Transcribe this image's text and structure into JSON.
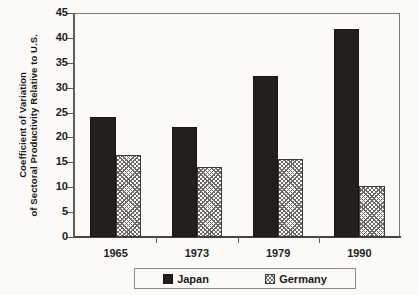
{
  "chart_data": {
    "type": "bar",
    "title": "",
    "xlabel": "",
    "ylabel_line1": "Coefficient of Variation",
    "ylabel_line2": "of Sectoral Productivity Relative to U.S.",
    "categories": [
      "1965",
      "1973",
      "1979",
      "1990"
    ],
    "series": [
      {
        "name": "Japan",
        "values": [
          24.1,
          22.2,
          32.4,
          41.7
        ],
        "color": "#241f1a",
        "pattern": "solid"
      },
      {
        "name": "Germany",
        "values": [
          16.4,
          14.0,
          15.7,
          10.3
        ],
        "color": "#6b6b63",
        "pattern": "cross-hatch"
      }
    ],
    "ylim": [
      0,
      45
    ],
    "yticks": [
      0,
      5,
      10,
      15,
      20,
      25,
      30,
      35,
      40,
      45
    ],
    "ytick_labels": [
      "0",
      "5",
      "10",
      "15",
      "20",
      "25",
      "30",
      "35",
      "40",
      "45"
    ],
    "grid": false,
    "legend_position": "bottom",
    "legend_entries": [
      "Japan",
      "Germany"
    ]
  }
}
